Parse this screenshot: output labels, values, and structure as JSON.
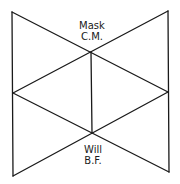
{
  "diagram": {
    "stroke_color": "#1a1a1a",
    "background": "#ffffff",
    "vertices": {
      "top_left": [
        12,
        12
      ],
      "top_right": [
        168,
        11
      ],
      "mid_left": [
        13,
        93
      ],
      "mid_right": [
        168,
        92
      ],
      "bottom_left": [
        13,
        176
      ],
      "bottom_right": [
        169,
        172
      ],
      "upper_center": [
        91,
        52
      ],
      "lower_center": [
        92,
        133
      ]
    },
    "labels": {
      "top": {
        "line1": "Mask",
        "line2": "C.M."
      },
      "bottom": {
        "line1": "Will",
        "line2": "B.F."
      }
    }
  }
}
